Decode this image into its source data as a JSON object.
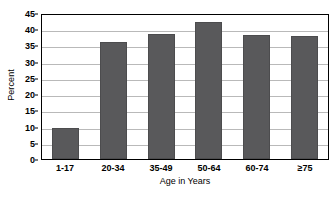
{
  "chart_data": {
    "type": "bar",
    "title": "",
    "subtitle": "",
    "xlabel": "Age in Years",
    "ylabel": "Percent",
    "categories": [
      "1-17",
      "20-34",
      "35-49",
      "50-64",
      "60-74",
      "≥75"
    ],
    "values": [
      9.5,
      36.2,
      38.4,
      42.3,
      38.1,
      37.9
    ],
    "series": [
      {
        "name": "Percent",
        "values": [
          9.5,
          36.2,
          38.4,
          42.3,
          38.1,
          37.9
        ]
      }
    ],
    "ylim": [
      0,
      45
    ],
    "ytick_step": 5,
    "yticks": [
      0,
      5,
      10,
      15,
      20,
      25,
      30,
      35,
      40,
      45
    ],
    "ytick_labels": [
      "0",
      "5",
      "10",
      "15",
      "20",
      "25",
      "30",
      "35",
      "40",
      "45"
    ],
    "grid": true,
    "grid_axis": "y",
    "legend": false,
    "legend_position": "none",
    "bar_color": "#59595b",
    "grid_color": "#b9b9b9",
    "frame_color": "#000000",
    "background_color": "#ffffff"
  }
}
